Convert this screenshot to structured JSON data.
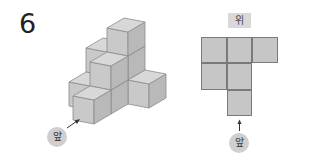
{
  "problem": {
    "number": "6"
  },
  "solid_view": {
    "front_label": "앞",
    "colors": {
      "front": "#c9c9c9",
      "side": "#b9b9b9",
      "top": "#d8d8d8",
      "edge": "#8c8c8c"
    },
    "stacks": [
      {
        "col": 0,
        "depth": 2,
        "height": 2
      },
      {
        "col": 1,
        "depth": 2,
        "height": 3
      },
      {
        "col": 2,
        "depth": 2,
        "height": 1
      },
      {
        "col": 0,
        "depth": 1,
        "height": 1
      },
      {
        "col": 1,
        "depth": 1,
        "height": 2
      },
      {
        "col": 1,
        "depth": 0,
        "height": 1
      }
    ]
  },
  "top_view": {
    "title": "위",
    "front_label": "앞",
    "cells": [
      {
        "row": 0,
        "col": 0
      },
      {
        "row": 0,
        "col": 1
      },
      {
        "row": 0,
        "col": 2
      },
      {
        "row": 1,
        "col": 0
      },
      {
        "row": 1,
        "col": 1
      },
      {
        "row": 2,
        "col": 1
      }
    ]
  }
}
